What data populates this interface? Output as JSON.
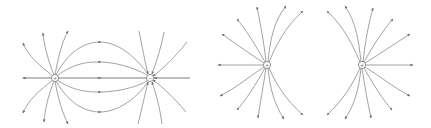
{
  "figure": {
    "description": "Electric field line diagrams",
    "line_color": "#8a8a8a",
    "arrow_color": "#6e6e6e",
    "background": "#ffffff"
  },
  "panels": [
    {
      "id": "dipole",
      "label": "Electric dipole",
      "charges": [
        {
          "name": "positive-charge",
          "sign": "+",
          "x": 55,
          "y": 78
        },
        {
          "name": "negative-charge",
          "sign": "−",
          "x": 150,
          "y": 78
        }
      ]
    },
    {
      "id": "like-charge-left",
      "label": "Positive charge (repelled by charge to the right)",
      "charges": [
        {
          "name": "positive-charge",
          "sign": "+",
          "x": 267,
          "y": 65
        }
      ]
    },
    {
      "id": "like-charge-right",
      "label": "Positive charge (repelled by charge to the left)",
      "charges": [
        {
          "name": "positive-charge",
          "sign": "+",
          "x": 362,
          "y": 65
        }
      ]
    }
  ]
}
